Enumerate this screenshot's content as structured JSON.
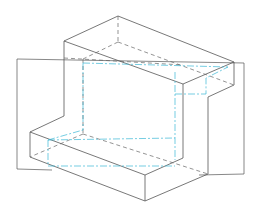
{
  "diagram": {
    "type": "isometric-line-drawing",
    "colors": {
      "visible_edges": "#555555",
      "hidden_edges": "#666666",
      "section_lines": "#3bb8d6",
      "background": "#ffffff"
    },
    "line_types": [
      "visible",
      "hidden",
      "section"
    ]
  }
}
